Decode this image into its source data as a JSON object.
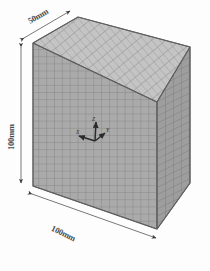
{
  "figure": {
    "type": "3d-mesh-model",
    "background_color": "#fdfdfd"
  },
  "dimensions": [
    {
      "id": "depth",
      "label": "50mm",
      "axis": "depth",
      "value": 50,
      "unit": "mm"
    },
    {
      "id": "height",
      "label": "100mm",
      "axis": "height",
      "value": 100,
      "unit": "mm"
    },
    {
      "id": "width",
      "label": "100mm",
      "axis": "width",
      "value": 100,
      "unit": "mm"
    }
  ],
  "mesh": {
    "front_divisions_x": 20,
    "front_divisions_y": 20,
    "side_divisions": 10,
    "front_color": "#a9a9a9",
    "side_color": "#9a9a9a",
    "top_color": "#c2c2c2",
    "line_color": "#7d7d7d"
  },
  "triad": {
    "name": "coordinate-axis-triad",
    "axes": [
      {
        "id": "x",
        "label": "X"
      },
      {
        "id": "y",
        "label": "Y"
      },
      {
        "id": "z",
        "label": "Z"
      }
    ],
    "color": "#2b2b2b"
  },
  "annotations": {
    "arrow_color": "#3a3a3a",
    "leader_color": "#555555"
  }
}
